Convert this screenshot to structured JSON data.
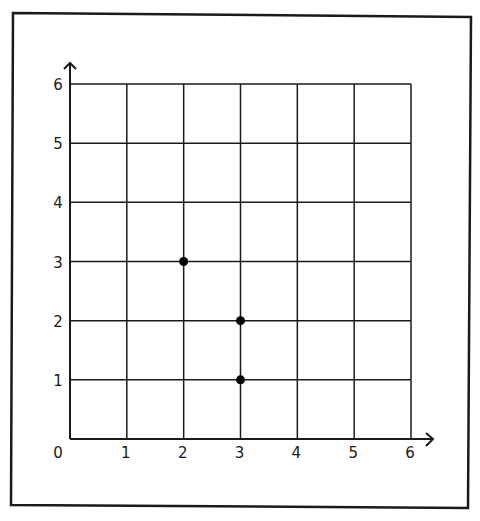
{
  "chart_data": {
    "type": "scatter",
    "title": "",
    "xlabel": "",
    "ylabel": "",
    "xlim": [
      0,
      6
    ],
    "ylim": [
      0,
      6
    ],
    "grid": true,
    "legend": null,
    "x_ticks": [
      "0",
      "1",
      "2",
      "3",
      "4",
      "5",
      "6"
    ],
    "y_ticks": [
      "1",
      "2",
      "3",
      "4",
      "5",
      "6"
    ],
    "origin_label": "0",
    "series": [
      {
        "name": "points",
        "points": [
          {
            "x": 2,
            "y": 3
          },
          {
            "x": 3,
            "y": 2
          },
          {
            "x": 3,
            "y": 1
          }
        ]
      }
    ],
    "colors": {
      "line": "#1a1a1a",
      "point": "#000000",
      "background": "#ffffff"
    }
  }
}
